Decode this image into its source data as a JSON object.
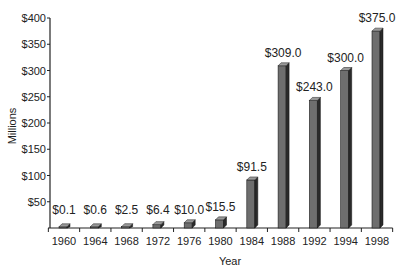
{
  "chart_data": {
    "type": "bar",
    "title": "",
    "xlabel": "Year",
    "ylabel": "Millions",
    "ylim": [
      0,
      400
    ],
    "yticks": [
      50,
      100,
      150,
      200,
      250,
      300,
      350,
      400
    ],
    "ytick_labels": [
      "$50",
      "$100",
      "$150",
      "$200",
      "$250",
      "$300",
      "$350",
      "$400"
    ],
    "categories": [
      "1960",
      "1964",
      "1968",
      "1972",
      "1976",
      "1980",
      "1984",
      "1988",
      "1992",
      "1994",
      "1998"
    ],
    "values": [
      0.1,
      0.6,
      2.5,
      6.4,
      10.0,
      15.5,
      91.5,
      309.0,
      243.0,
      300.0,
      375.0
    ],
    "value_labels": [
      "$0.1",
      "$0.6",
      "$2.5",
      "$6.4",
      "$10.0",
      "$15.5",
      "$91.5",
      "$309.0",
      "$243.0",
      "$300.0",
      "$375.0"
    ],
    "grid": false,
    "legend": null,
    "style": "3d-bar",
    "colors": {
      "bar_front": "#6e6e6e",
      "bar_side": "#2a2a2a",
      "bar_top": "#9a9a9a",
      "axis": "#222222"
    }
  }
}
